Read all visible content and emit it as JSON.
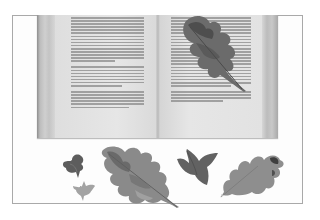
{
  "image": {
    "description": "Grayscale photograph of an open book with pressed autumn leaves",
    "subject": "open-book-with-pressed-leaves",
    "palette": {
      "background": "#ffffff",
      "frame": "#a9a9a9",
      "page": "#e2e2e2",
      "text": "#8a8a8a",
      "leaf_dark": "#5a5a5a",
      "leaf_mid": "#858585",
      "leaf_light": "#a6a6a6"
    },
    "objects": [
      {
        "name": "open-book",
        "region": [
          37,
          15,
          241,
          123
        ]
      },
      {
        "name": "oak-leaf-on-page",
        "region": [
          178,
          15,
          70,
          75
        ]
      },
      {
        "name": "small-ivy-leaf-dark",
        "region": [
          62,
          152,
          24,
          25
        ]
      },
      {
        "name": "small-ivy-leaf-light",
        "region": [
          72,
          180,
          22,
          20
        ]
      },
      {
        "name": "large-oak-leaf",
        "region": [
          99,
          145,
          78,
          60
        ]
      },
      {
        "name": "ivy-leaf",
        "region": [
          175,
          147,
          42,
          38
        ]
      },
      {
        "name": "oak-leaf-right",
        "region": [
          218,
          150,
          66,
          48
        ]
      }
    ],
    "text_legible": false
  }
}
